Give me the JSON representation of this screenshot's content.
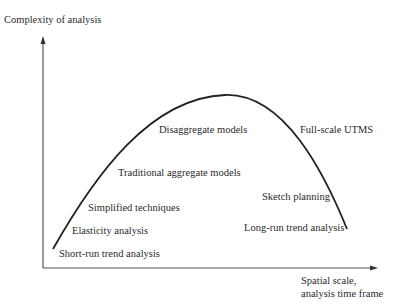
{
  "diagram": {
    "y_axis_label": "Complexity of analysis",
    "x_axis_label_line1": "Spatial scale,",
    "x_axis_label_line2": "analysis time frame",
    "curve_labels": [
      {
        "text": "Short-run trend analysis"
      },
      {
        "text": "Elasticity analysis"
      },
      {
        "text": "Simplified techniques"
      },
      {
        "text": "Traditional aggregate models"
      },
      {
        "text": "Disaggregate models"
      },
      {
        "text": "Full-scale UTMS"
      },
      {
        "text": "Sketch planning"
      },
      {
        "text": "Long-run trend analysis"
      }
    ],
    "colors": {
      "line": "#222222",
      "axis": "#555555",
      "text": "#2a2a2a"
    }
  }
}
